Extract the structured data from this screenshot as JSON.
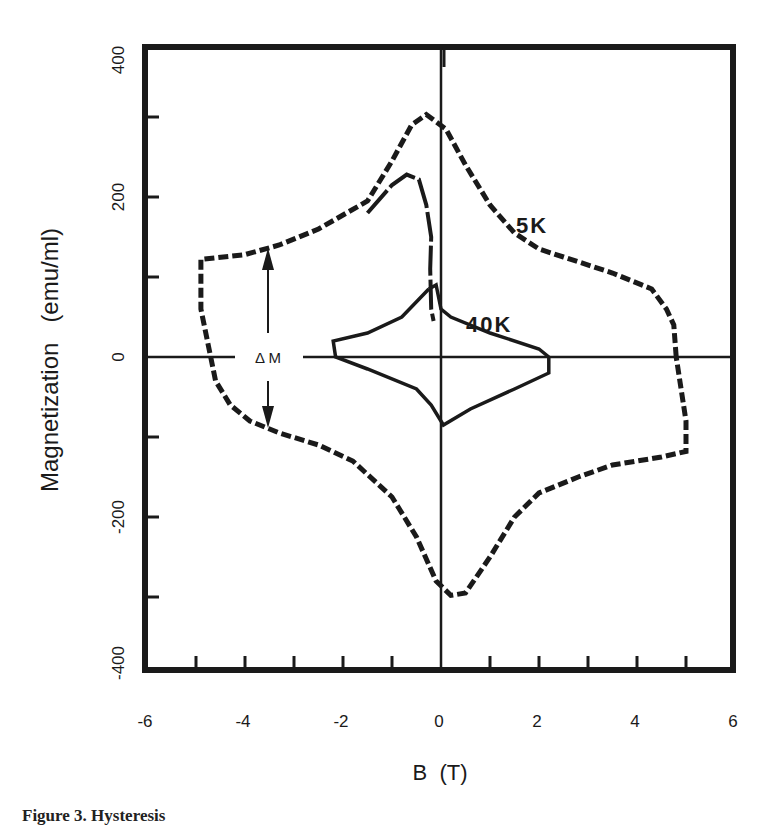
{
  "chart_data": {
    "type": "line",
    "title": "",
    "xlabel": "B  (T)",
    "ylabel": "Magnetization   (emu/ml)",
    "xlim": [
      -6,
      6
    ],
    "ylim": [
      -400,
      400
    ],
    "xticks": [
      -6,
      -4,
      -2,
      0,
      2,
      4,
      6
    ],
    "yticks": [
      -400,
      -200,
      0,
      200,
      400
    ],
    "grid": false,
    "legend": "inline labels",
    "annotations": [
      {
        "text": "5K",
        "x": 2.2,
        "y": 165
      },
      {
        "text": "40K",
        "x": 0.65,
        "y": 40
      },
      {
        "text": "ΔM",
        "text_plain": "Delta M",
        "x": -3.4,
        "y": 0,
        "description": "double-headed vertical arrow spanning the 5K loop width at B≈-3.4 T"
      }
    ],
    "series": [
      {
        "name": "5K",
        "style": "dashed-step",
        "points": [
          [
            4.8,
            0
          ],
          [
            4.75,
            40
          ],
          [
            4.6,
            60
          ],
          [
            4.3,
            85
          ],
          [
            3.5,
            105
          ],
          [
            2.5,
            125
          ],
          [
            2.0,
            135
          ],
          [
            1.5,
            155
          ],
          [
            1.0,
            190
          ],
          [
            0.5,
            240
          ],
          [
            0.1,
            285
          ],
          [
            -0.3,
            303
          ],
          [
            -0.6,
            290
          ],
          [
            -1.0,
            245
          ],
          [
            -1.5,
            195
          ],
          [
            -2.5,
            160
          ],
          [
            -3.3,
            140
          ],
          [
            -4.0,
            128
          ],
          [
            -4.9,
            122
          ],
          [
            -4.9,
            60
          ],
          [
            -4.7,
            0
          ],
          [
            -4.6,
            -30
          ],
          [
            -4.3,
            -60
          ],
          [
            -3.9,
            -80
          ],
          [
            -3.3,
            -95
          ],
          [
            -2.5,
            -110
          ],
          [
            -1.8,
            -130
          ],
          [
            -1.0,
            -175
          ],
          [
            -0.5,
            -225
          ],
          [
            -0.1,
            -280
          ],
          [
            0.2,
            -298
          ],
          [
            0.5,
            -295
          ],
          [
            1.0,
            -250
          ],
          [
            1.5,
            -200
          ],
          [
            2.0,
            -170
          ],
          [
            2.8,
            -150
          ],
          [
            3.5,
            -135
          ],
          [
            4.5,
            -125
          ],
          [
            5.0,
            -118
          ],
          [
            5.0,
            -80
          ],
          [
            4.8,
            0
          ]
        ]
      },
      {
        "name": "5K-inner-branch",
        "style": "solid-step",
        "points": [
          [
            -1.5,
            180
          ],
          [
            -1.0,
            215
          ],
          [
            -0.7,
            228
          ],
          [
            -0.45,
            222
          ],
          [
            -0.3,
            190
          ],
          [
            -0.2,
            150
          ],
          [
            -0.22,
            110
          ],
          [
            -0.2,
            60
          ],
          [
            -0.15,
            45
          ]
        ]
      },
      {
        "name": "40K",
        "style": "solid-step",
        "points": [
          [
            -0.25,
            85
          ],
          [
            -0.1,
            90
          ],
          [
            0.0,
            60
          ],
          [
            0.2,
            50
          ],
          [
            1.0,
            30
          ],
          [
            2.0,
            10
          ],
          [
            2.2,
            0
          ],
          [
            2.2,
            -20
          ],
          [
            1.5,
            -40
          ],
          [
            0.6,
            -65
          ],
          [
            0.05,
            -85
          ],
          [
            -0.2,
            -60
          ],
          [
            -0.5,
            -40
          ],
          [
            -1.5,
            -15
          ],
          [
            -2.15,
            0
          ],
          [
            -2.2,
            20
          ],
          [
            -1.5,
            30
          ],
          [
            -0.8,
            50
          ],
          [
            -0.25,
            85
          ]
        ]
      }
    ]
  },
  "axes": {
    "x_tick_labels": [
      "-6",
      "-4",
      "-2",
      "0",
      "2",
      "4",
      "6"
    ],
    "y_tick_labels": [
      "400",
      "200",
      "0",
      "-200",
      "-400"
    ],
    "x_label": "B  (T)",
    "y_label": "Magnetization   (emu/ml)"
  },
  "labels": {
    "curve_5k": "5K",
    "curve_40k": "40K",
    "delta_m": "Δ M"
  },
  "caption": {
    "text": "Figure 3.  Hysteresis"
  },
  "colors": {
    "ink": "#1a1a1a",
    "background": "#ffffff"
  }
}
